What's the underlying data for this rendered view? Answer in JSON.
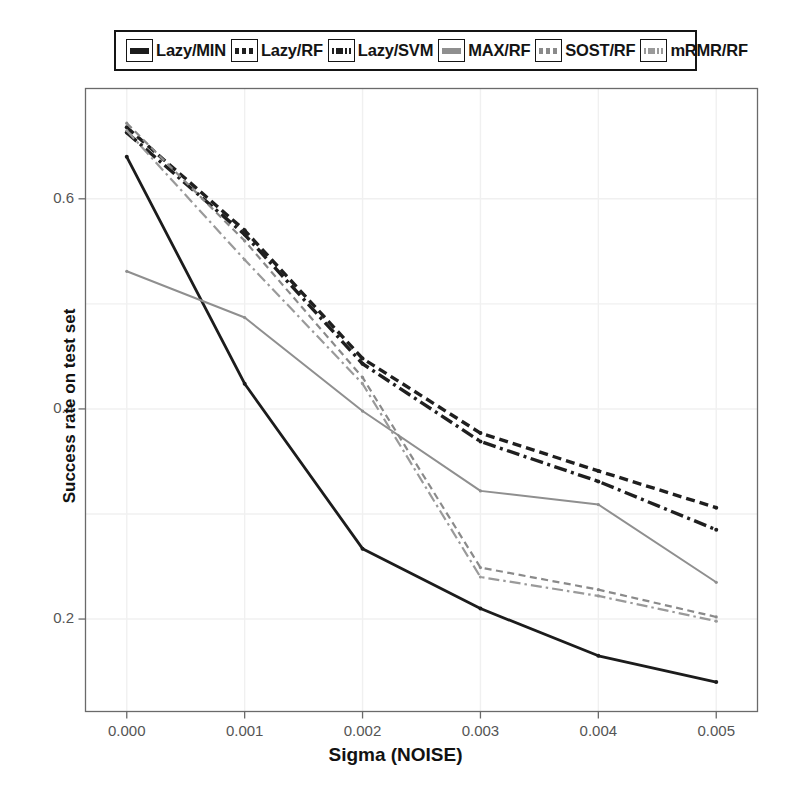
{
  "chart_data": {
    "type": "line",
    "title": "",
    "xlabel": "Sigma (NOISE)",
    "ylabel": "Success rate on test set",
    "x": [
      0.0,
      0.001,
      0.002,
      0.003,
      0.004,
      0.005
    ],
    "xtick_labels": [
      "0.000",
      "0.001",
      "0.002",
      "0.003",
      "0.004",
      "0.005"
    ],
    "ytick_labels": [
      "0.2",
      "0.4",
      "0.6"
    ],
    "ytick_values": [
      0.2,
      0.4,
      0.6
    ],
    "xlim": [
      -0.00035,
      0.00535
    ],
    "ylim": [
      0.112,
      0.705
    ],
    "grid": true,
    "legend_position": "above-plot",
    "series": [
      {
        "name": "Lazy/MIN",
        "color": "#1c1c1c",
        "style": "solid",
        "values": [
          0.64,
          0.424,
          0.267,
          0.21,
          0.165,
          0.14
        ]
      },
      {
        "name": "Lazy/RF",
        "color": "#1f1f1f",
        "style": "dashed",
        "values": [
          0.668,
          0.57,
          0.448,
          0.377,
          0.341,
          0.306
        ]
      },
      {
        "name": "Lazy/SVM",
        "color": "#1f1f1f",
        "style": "dashdot",
        "values": [
          0.663,
          0.566,
          0.443,
          0.369,
          0.331,
          0.285
        ]
      },
      {
        "name": "MAX/RF",
        "color": "#8f8f8f",
        "style": "solid",
        "values": [
          0.531,
          0.487,
          0.398,
          0.322,
          0.309,
          0.235
        ]
      },
      {
        "name": "SOST/RF",
        "color": "#8a8a8a",
        "style": "dashed",
        "values": [
          0.672,
          0.56,
          0.43,
          0.249,
          0.228,
          0.202
        ]
      },
      {
        "name": "mRMR/RF",
        "color": "#9a9a9a",
        "style": "dashdot",
        "values": [
          0.665,
          0.542,
          0.424,
          0.24,
          0.222,
          0.198
        ]
      }
    ]
  },
  "legend": {
    "entries": [
      {
        "label": "Lazy/MIN",
        "key": "solid-black-line-key"
      },
      {
        "label": "Lazy/RF",
        "key": "dashed-black-line-key"
      },
      {
        "label": "Lazy/SVM",
        "key": "dashdot-black-line-key"
      },
      {
        "label": "MAX/RF",
        "key": "solid-gray-line-key"
      },
      {
        "label": "SOST/RF",
        "key": "dashed-gray-line-key"
      },
      {
        "label": "mRMR/RF",
        "key": "dashdot-gray-line-key"
      }
    ]
  },
  "axes": {
    "x_title": "Sigma (NOISE)",
    "y_title": "Success rate on test set"
  },
  "colors": {
    "black_series": "#1c1c1c",
    "gray_series": "#8f8f8f",
    "frame": "#6a6a6a",
    "grid": "#f0f0f0",
    "tick_text": "#555555"
  }
}
